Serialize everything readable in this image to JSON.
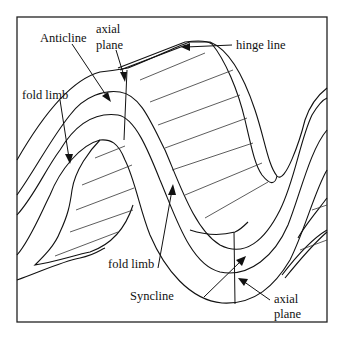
{
  "diagram": {
    "labels": {
      "anticline": "Anticline",
      "axial_plane_top_line1": "axial",
      "axial_plane_top_line2": "plane",
      "hinge_line": "hinge line",
      "fold_limb_left": "fold limb",
      "fold_limb_bottom": "fold limb",
      "syncline": "Syncline",
      "axial_plane_bottom_line1": "axial",
      "axial_plane_bottom_line2": "plane"
    },
    "colors": {
      "stroke": "#111111",
      "background": "#ffffff"
    }
  }
}
